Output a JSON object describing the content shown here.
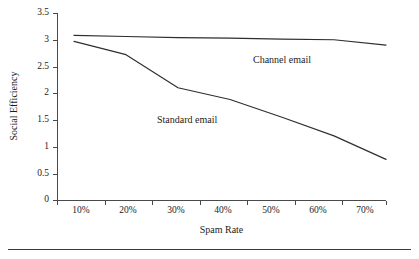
{
  "chart_data": {
    "type": "line",
    "title": "",
    "xlabel": "Spam Rate",
    "ylabel": "Social Efficiency",
    "categories": [
      "10%",
      "20%",
      "30%",
      "40%",
      "50%",
      "60%",
      "70%"
    ],
    "x": [
      10,
      20,
      30,
      40,
      50,
      60,
      70
    ],
    "xlim": [
      10,
      70
    ],
    "ylim": [
      0,
      3.5
    ],
    "yticks": [
      0,
      0.5,
      1,
      1.5,
      2,
      2.5,
      3,
      3.5
    ],
    "ytick_labels": [
      "0",
      "0.5",
      "1",
      "1.5",
      "2",
      "2.5",
      "3",
      "3.5"
    ],
    "xtick_labels": [
      "10%",
      "20%",
      "30%",
      "40%",
      "50%",
      "60%",
      "70%"
    ],
    "grid": false,
    "legend_position": "inline-annotation",
    "series": [
      {
        "name": "Channel email",
        "label": "Channel email",
        "color": "#2e2e2e",
        "values": [
          3.08,
          3.06,
          3.04,
          3.03,
          3.01,
          3.0,
          2.9
        ]
      },
      {
        "name": "Standard email",
        "label": "Standard email",
        "color": "#2e2e2e",
        "values": [
          2.97,
          2.72,
          2.1,
          1.88,
          1.55,
          1.2,
          0.76
        ]
      }
    ],
    "annotations": [
      {
        "text": "Channel email",
        "x": 50,
        "y": 2.6
      },
      {
        "text": "Standard email",
        "x": 28,
        "y": 1.45
      }
    ]
  },
  "axes": {
    "y_title": "Social Efficiency",
    "x_title": "Spam Rate",
    "y_tick_labels": [
      "3.5",
      "3",
      "2.5",
      "2",
      "1.5",
      "1",
      "0.5",
      "0"
    ],
    "x_tick_labels": [
      "10%",
      "20%",
      "30%",
      "40%",
      "50%",
      "60%",
      "70%"
    ]
  },
  "annotations": {
    "channel": "Channel email",
    "standard": "Standard email"
  }
}
